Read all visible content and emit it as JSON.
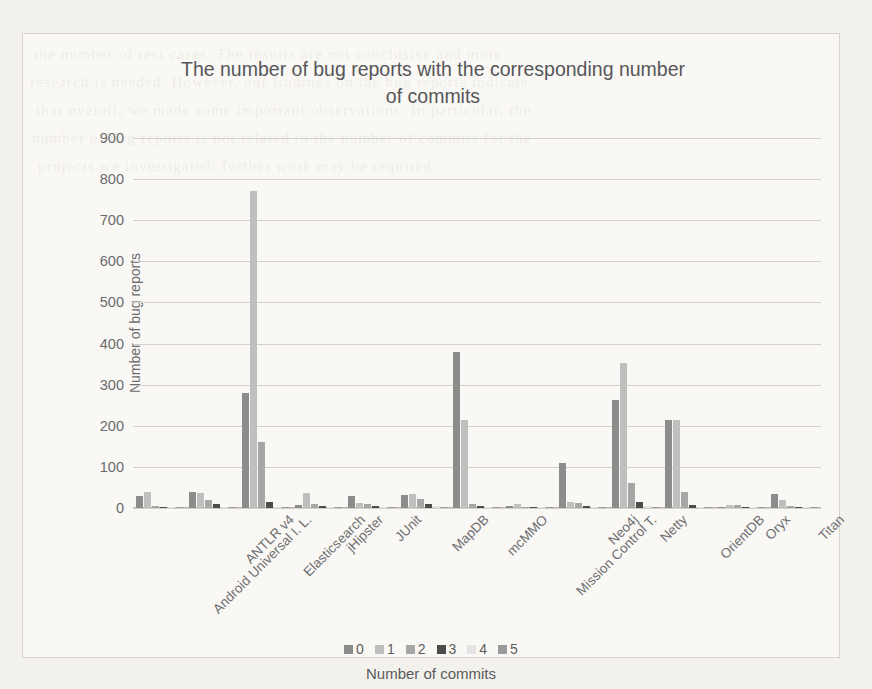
{
  "chart_data": {
    "type": "bar",
    "title": "The number of bug reports with the corresponding number of commits",
    "title_line1": "The number of bug reports with the corresponding number",
    "title_line2": "of commits",
    "xlabel": "Number of commits",
    "ylabel": "Number of bug reports",
    "ylim": [
      0,
      900
    ],
    "yticks": [
      0,
      100,
      200,
      300,
      400,
      500,
      600,
      700,
      800,
      900
    ],
    "grid": true,
    "legend_position": "bottom",
    "legend_title": "Number of commits",
    "categories": [
      "Android Universal I. L.",
      "ANTLR v4",
      "Elasticsearch",
      "jHipster",
      "JUnit",
      "MapDB",
      "mcMMO",
      "Mission Control T.",
      "Neo4j",
      "Netty",
      "OrientDB",
      "Oryx",
      "Titan"
    ],
    "series": [
      {
        "name": "0",
        "color": "#8c8c8c",
        "values": [
          30,
          38,
          280,
          8,
          30,
          32,
          380,
          4,
          110,
          263,
          215,
          3,
          35
        ]
      },
      {
        "name": "1",
        "color": "#bfbfbf",
        "values": [
          38,
          36,
          770,
          36,
          12,
          35,
          215,
          10,
          15,
          353,
          213,
          7,
          20
        ]
      },
      {
        "name": "2",
        "color": "#a6a6a6",
        "values": [
          6,
          20,
          160,
          9,
          9,
          22,
          10,
          3,
          12,
          62,
          38,
          8,
          5
        ]
      },
      {
        "name": "3",
        "color": "#4c4c4c",
        "values": [
          2,
          9,
          14,
          4,
          4,
          10,
          5,
          1,
          4,
          15,
          8,
          2,
          2
        ]
      },
      {
        "name": "4",
        "color": "#e3e3e3",
        "values": [
          1,
          3,
          3,
          2,
          2,
          4,
          2,
          1,
          2,
          4,
          3,
          1,
          1
        ]
      },
      {
        "name": "5",
        "color": "#9a9a9a",
        "values": [
          1,
          2,
          2,
          1,
          1,
          2,
          1,
          1,
          1,
          3,
          2,
          1,
          1
        ]
      }
    ]
  },
  "scan_bleed": {
    "lines": [
      "the number of test cases. The results are not conclusive and more",
      "research is needed. However, our findings on the bug reports indicate",
      "that overall, we made some important observations. In particular, the",
      "number of bug reports is not related to the number of commits for the",
      "projects we investigated; further work may be required."
    ]
  }
}
